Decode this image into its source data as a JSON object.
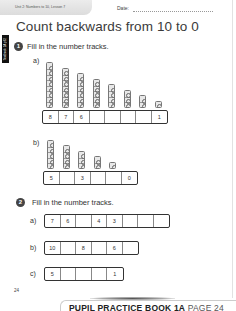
{
  "header": {
    "unit_lesson": "Unit 2: Numbers to 10, Lesson 7",
    "date_label": "Date:"
  },
  "side_tab": {
    "label": "Textbook 1A p62"
  },
  "title": "Count backwards from 10 to 0",
  "questions": [
    {
      "number": "1",
      "instruction": "Fill in the number tracks.",
      "parts": [
        {
          "label": "a)",
          "towers": [
            8,
            7,
            6,
            5,
            4,
            3,
            2,
            1
          ],
          "track": [
            "8",
            "7",
            "6",
            "",
            "",
            "",
            "",
            "1"
          ]
        },
        {
          "label": "b)",
          "towers": [
            5,
            4,
            3,
            2,
            1
          ],
          "track": [
            "5",
            "",
            "3",
            "",
            "",
            "0"
          ]
        }
      ]
    },
    {
      "number": "2",
      "instruction": "Fill in the number tracks.",
      "parts": [
        {
          "label": "a)",
          "track": [
            "7",
            "6",
            "",
            "4",
            "3",
            "",
            "",
            ""
          ]
        },
        {
          "label": "b)",
          "track": [
            "10",
            "",
            "8",
            "",
            "6",
            ""
          ]
        },
        {
          "label": "c)",
          "track": [
            "5",
            "",
            "",
            "",
            "1"
          ]
        }
      ]
    }
  ],
  "page_number": "24",
  "banner": {
    "book": "PUPIL PRACTICE BOOK 1A",
    "page": "PAGE 24"
  }
}
